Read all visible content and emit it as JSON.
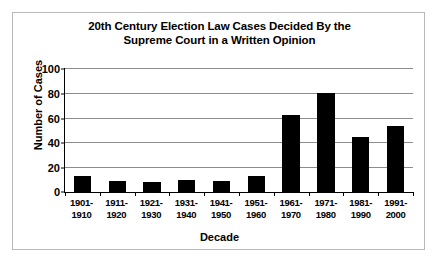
{
  "chart_data": {
    "type": "bar",
    "title": "20th Century Election Law Cases Decided By the Supreme Court in a Written Opinion",
    "title_line1": "20th Century Election Law Cases Decided By the",
    "title_line2": "Supreme Court in a Written Opinion",
    "xlabel": "Decade",
    "ylabel": "Number of Cases",
    "ylim": [
      0,
      100
    ],
    "yticks": [
      0,
      20,
      40,
      60,
      80,
      100
    ],
    "ytick_labels": [
      "0",
      "20",
      "40",
      "60",
      "80",
      "100"
    ],
    "grid": true,
    "legend": "none",
    "bar_color": "#000000",
    "categories": [
      "1901-1910",
      "1911-1920",
      "1921-1930",
      "1931-1940",
      "1941-1950",
      "1951-1960",
      "1961-1970",
      "1971-1980",
      "1981-1990",
      "1991-2000"
    ],
    "category_lines": [
      {
        "top": "1901-",
        "bottom": "1910"
      },
      {
        "top": "1911-",
        "bottom": "1920"
      },
      {
        "top": "1921-",
        "bottom": "1930"
      },
      {
        "top": "1931-",
        "bottom": "1940"
      },
      {
        "top": "1941-",
        "bottom": "1950"
      },
      {
        "top": "1951-",
        "bottom": "1960"
      },
      {
        "top": "1961-",
        "bottom": "1970"
      },
      {
        "top": "1971-",
        "bottom": "1980"
      },
      {
        "top": "1981-",
        "bottom": "1990"
      },
      {
        "top": "1991-",
        "bottom": "2000"
      }
    ],
    "values": [
      13,
      9,
      8,
      10,
      9,
      13,
      62,
      80,
      44,
      53
    ]
  }
}
